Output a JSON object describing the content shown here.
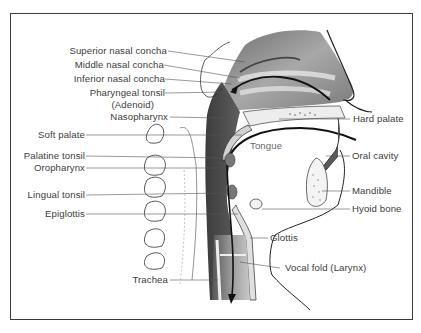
{
  "diagram": {
    "type": "anatomical-illustration",
    "left_labels": [
      {
        "text": "Superior nasal concha"
      },
      {
        "text": "Middle nasal concha"
      },
      {
        "text": "Inferior nasal concha"
      },
      {
        "text": "Pharyngeal tonsil"
      },
      {
        "text": "(Adenoid)"
      },
      {
        "text": "Nasopharynx"
      },
      {
        "text": "Soft palate"
      },
      {
        "text": "Palatine tonsil"
      },
      {
        "text": "Oropharynx"
      },
      {
        "text": "Lingual tonsil"
      },
      {
        "text": "Epiglottis"
      },
      {
        "text": "Trachea"
      }
    ],
    "right_labels": [
      {
        "text": "Hard palate"
      },
      {
        "text": "Oral cavity"
      },
      {
        "text": "Mandible"
      },
      {
        "text": "Hyoid bone"
      },
      {
        "text": "Glottis"
      },
      {
        "text": "Vocal fold (Larynx)"
      }
    ],
    "inner_labels": [
      {
        "text": "Tongue"
      }
    ],
    "colors": {
      "frame": "#3a3a3a",
      "label_text": "#3c3c3c",
      "tissue_dark": "#4a4a4a",
      "tissue_mid": "#8a8a8a",
      "tissue_light": "#c4c4c4"
    }
  }
}
